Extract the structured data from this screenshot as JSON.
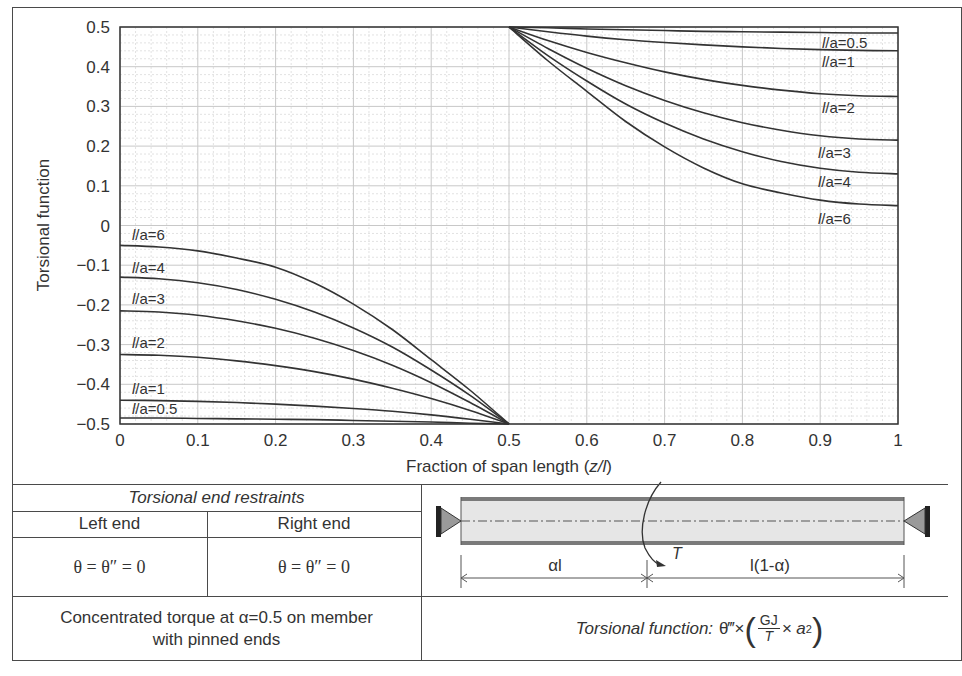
{
  "chart_data": {
    "type": "line",
    "title": "",
    "xlabel": "Fraction of span length (z/l)",
    "ylabel": "Torsional function",
    "xlim": [
      0,
      1
    ],
    "ylim": [
      -0.5,
      0.5
    ],
    "xticks": [
      "0",
      "0.1",
      "0.2",
      "0.3",
      "0.4",
      "0.5",
      "0.6",
      "0.7",
      "0.8",
      "0.9",
      "1"
    ],
    "yticks": [
      "0.5",
      "0.4",
      "0.3",
      "0.2",
      "0.1",
      "0",
      "−0.1",
      "−0.2",
      "−0.3",
      "−0.4",
      "−0.5"
    ],
    "grid": true,
    "legend_position": "inline labels at curve ends",
    "x": [
      0,
      0.05,
      0.1,
      0.15,
      0.2,
      0.25,
      0.3,
      0.35,
      0.4,
      0.45,
      0.5,
      0.5,
      0.55,
      0.6,
      0.65,
      0.7,
      0.75,
      0.8,
      0.85,
      0.9,
      0.95,
      1.0
    ],
    "series": [
      {
        "name": "l/a=0.5",
        "values": [
          -0.485,
          -0.485,
          -0.486,
          -0.487,
          -0.488,
          -0.489,
          -0.491,
          -0.493,
          -0.495,
          -0.498,
          -0.5,
          0.5,
          0.498,
          0.495,
          0.493,
          0.491,
          0.489,
          0.488,
          0.487,
          0.486,
          0.485,
          0.485
        ]
      },
      {
        "name": "l/a=1",
        "values": [
          -0.44,
          -0.441,
          -0.443,
          -0.446,
          -0.45,
          -0.455,
          -0.461,
          -0.468,
          -0.477,
          -0.488,
          -0.5,
          0.5,
          0.488,
          0.477,
          0.468,
          0.461,
          0.455,
          0.45,
          0.446,
          0.443,
          0.441,
          0.44
        ]
      },
      {
        "name": "l/a=2",
        "values": [
          -0.325,
          -0.327,
          -0.332,
          -0.341,
          -0.353,
          -0.368,
          -0.387,
          -0.41,
          -0.436,
          -0.466,
          -0.5,
          0.5,
          0.466,
          0.436,
          0.41,
          0.387,
          0.368,
          0.353,
          0.341,
          0.332,
          0.327,
          0.325
        ]
      },
      {
        "name": "l/a=3",
        "values": [
          -0.215,
          -0.218,
          -0.226,
          -0.24,
          -0.259,
          -0.284,
          -0.315,
          -0.352,
          -0.396,
          -0.446,
          -0.5,
          0.5,
          0.446,
          0.396,
          0.352,
          0.315,
          0.284,
          0.259,
          0.24,
          0.226,
          0.218,
          0.215
        ]
      },
      {
        "name": "l/a=4",
        "values": [
          -0.13,
          -0.134,
          -0.144,
          -0.161,
          -0.186,
          -0.218,
          -0.258,
          -0.306,
          -0.364,
          -0.428,
          -0.5,
          0.5,
          0.428,
          0.364,
          0.306,
          0.258,
          0.218,
          0.186,
          0.161,
          0.144,
          0.134,
          0.13
        ]
      },
      {
        "name": "l/a=6",
        "values": [
          -0.05,
          -0.054,
          -0.064,
          -0.082,
          -0.105,
          -0.145,
          -0.198,
          -0.262,
          -0.338,
          -0.415,
          -0.5,
          0.5,
          0.415,
          0.338,
          0.262,
          0.198,
          0.145,
          0.105,
          0.082,
          0.064,
          0.054,
          0.05
        ]
      }
    ]
  },
  "chart": {
    "y_axis_title": "Torsional function",
    "x_axis_title_text": "Fraction of span length (",
    "x_axis_title_var": "z/l",
    "x_axis_title_close": ")",
    "right_labels": [
      {
        "l": "l",
        "rest": "/a=0.5"
      },
      {
        "l": "l",
        "rest": "/a=1"
      },
      {
        "l": "l",
        "rest": "/a=2"
      },
      {
        "l": "l",
        "rest": "/a=3"
      },
      {
        "l": "l",
        "rest": "/a=4"
      },
      {
        "l": "l",
        "rest": "/a=6"
      }
    ],
    "left_labels": [
      {
        "l": "l",
        "rest": "/a=6"
      },
      {
        "l": "l",
        "rest": "/a=4"
      },
      {
        "l": "l",
        "rest": "/a=3"
      },
      {
        "l": "l",
        "rest": "/a=2"
      },
      {
        "l": "l",
        "rest": "/a=1"
      },
      {
        "l": "l",
        "rest": "/a=0.5"
      }
    ]
  },
  "table": {
    "restraints_header": "Torsional end restraints",
    "left_end_label": "Left end",
    "right_end_label": "Right end",
    "left_end_condition": "θ = θ″ = 0",
    "right_end_condition": "θ = θ″ = 0",
    "case_description_line1": "Concentrated torque at α=0.5 on member",
    "case_description_line2": "with pinned ends",
    "function_prefix": "Torsional function:",
    "function_theta": "θ‴×",
    "function_num": "GJ",
    "function_den": "T",
    "function_tail": "× a",
    "function_exp": "2"
  },
  "diagram": {
    "torque_label": "T",
    "dim_left": "αl",
    "dim_right": "l(1-α)"
  },
  "colors": {
    "line": "#333333",
    "grid_major": "#c8c8c8",
    "grid_minor": "#e2e2e2",
    "beam_fill": "#e6e6e6",
    "support_fill": "#9a9a9a",
    "frame": "#4a4a4a"
  }
}
